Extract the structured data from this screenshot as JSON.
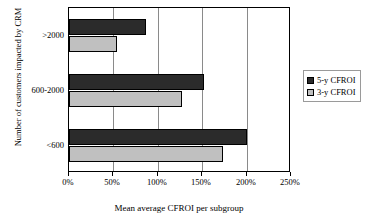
{
  "chart_data": {
    "type": "bar",
    "orientation": "horizontal",
    "title": "",
    "xlabel": "Mean average CFROI per subgroup",
    "ylabel": "Number of customers impacted by CRM",
    "categories": [
      ">2000",
      "600-2000",
      "<600"
    ],
    "series": [
      {
        "name": "5-y CFROI",
        "color": "#2b2b2b",
        "values": [
          87,
          152,
          200
        ]
      },
      {
        "name": "3-y CFROI",
        "color": "#c0c0c0",
        "values": [
          54,
          127,
          173
        ]
      }
    ],
    "xlim": [
      0,
      250
    ],
    "xticks": [
      0,
      50,
      100,
      150,
      200,
      250
    ],
    "xtick_labels": [
      "0%",
      "50%",
      "100%",
      "150%",
      "200%",
      "250%"
    ],
    "value_unit": "%",
    "grid": true,
    "grid_axis": "x",
    "legend_position": "right",
    "legend": [
      {
        "label": "5-y CFROI",
        "swatch": "#2b2b2b"
      },
      {
        "label": "3-y CFROI",
        "swatch": "#c0c0c0"
      }
    ]
  }
}
